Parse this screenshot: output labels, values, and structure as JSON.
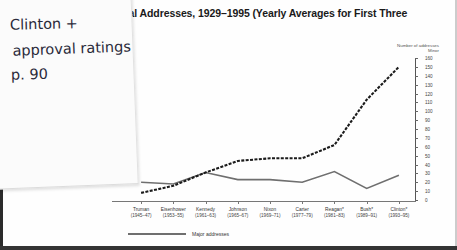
{
  "figure": {
    "title_visible_fragment": "dential Addresses, 1929–1995 (Yearly Averages for First Three",
    "axis_caption_line1": "Number of addresses",
    "axis_caption_line2": "Minor"
  },
  "note": {
    "line1": "Clinton +",
    "line2": "approval ratings",
    "line3": "p. 90"
  },
  "legend": [
    {
      "label": "Major addresses",
      "color": "#6f6f6f",
      "style": "solid"
    }
  ],
  "chart_data": {
    "type": "line",
    "xlabel": "",
    "ylabel": "Number of addresses",
    "ylim": [
      0,
      160
    ],
    "yticks": [
      0,
      10,
      20,
      30,
      40,
      50,
      60,
      70,
      80,
      90,
      100,
      110,
      120,
      130,
      140,
      150,
      160
    ],
    "grid": false,
    "legend_position": "bottom-left",
    "categories": [
      "Truman",
      "Eisenhower",
      "Kennedy",
      "Johnson",
      "Nixon",
      "Carter",
      "Reagan*",
      "Bush*",
      "Clinton*"
    ],
    "category_years": [
      "(1945–47)",
      "(1953–55)",
      "(1961–63)",
      "(1965–67)",
      "(1969–71)",
      "(1977–79)",
      "(1981–83)",
      "(1989–91)",
      "(1993–95)"
    ],
    "series": [
      {
        "name": "Minor addresses",
        "style": "dotted",
        "color": "#1b1b1b",
        "values": [
          8,
          16,
          31,
          44,
          47,
          47,
          62,
          113,
          150
        ]
      },
      {
        "name": "Major addresses",
        "style": "solid",
        "color": "#6f6f6f",
        "values": [
          20,
          18,
          31,
          23,
          23,
          20,
          32,
          13,
          28
        ]
      }
    ]
  }
}
